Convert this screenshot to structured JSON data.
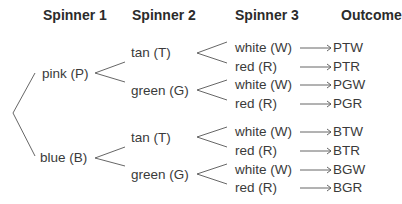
{
  "headers": {
    "spinner1": "Spinner 1",
    "spinner2": "Spinner 2",
    "spinner3": "Spinner 3",
    "outcome": "Outcome"
  },
  "spinner1": [
    {
      "label": "pink (P)"
    },
    {
      "label": "blue (B)"
    }
  ],
  "spinner2": [
    {
      "label": "tan (T)"
    },
    {
      "label": "green (G)"
    },
    {
      "label": "tan (T)"
    },
    {
      "label": "green (G)"
    }
  ],
  "spinner3": [
    {
      "label": "white (W)"
    },
    {
      "label": "red (R)"
    },
    {
      "label": "white (W)"
    },
    {
      "label": "red (R)"
    },
    {
      "label": "white (W)"
    },
    {
      "label": "red (R)"
    },
    {
      "label": "white (W)"
    },
    {
      "label": "red (R)"
    }
  ],
  "outcomes": [
    {
      "label": "PTW"
    },
    {
      "label": "PTR"
    },
    {
      "label": "PGW"
    },
    {
      "label": "PGR"
    },
    {
      "label": "BTW"
    },
    {
      "label": "BTR"
    },
    {
      "label": "BGW"
    },
    {
      "label": "BGR"
    }
  ],
  "colors": {
    "line": "#555555",
    "text": "#3a3a3a"
  }
}
